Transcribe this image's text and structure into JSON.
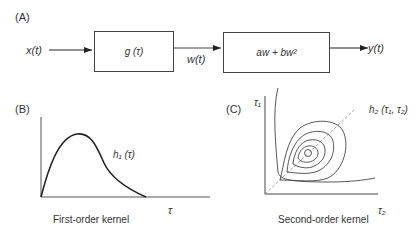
{
  "panel_a": {
    "label": "(A)",
    "input": "x(t)",
    "block1": "g (τ)",
    "intermediate": "w(t)",
    "block2": "aw + bw²",
    "output": "y(t)"
  },
  "panel_b": {
    "label": "(B)",
    "curve_label": "h₁ (τ)",
    "x_axis": "τ",
    "caption": "First-order kernel"
  },
  "panel_c": {
    "label": "(C)",
    "y_axis": "τ₁",
    "x_axis": "τ₂",
    "surface_label": "h₂ (τ₁, τ₂)",
    "caption": "Second-order kernel"
  }
}
